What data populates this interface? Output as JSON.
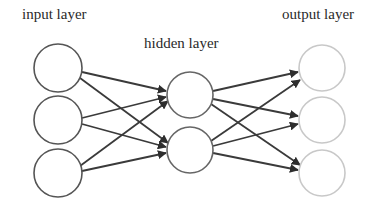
{
  "diagram": {
    "labels": {
      "input": "input layer",
      "hidden": "hidden layer",
      "output": "output layer"
    },
    "layers": [
      {
        "name": "input",
        "nodes": 3,
        "stroke": "#555555"
      },
      {
        "name": "hidden",
        "nodes": 2,
        "stroke": "#666666"
      },
      {
        "name": "output",
        "nodes": 3,
        "stroke": "#c8c8c8"
      }
    ],
    "edge_color": "#3a3a3a",
    "connections": "fully connected input→hidden and hidden→output with arrows"
  }
}
